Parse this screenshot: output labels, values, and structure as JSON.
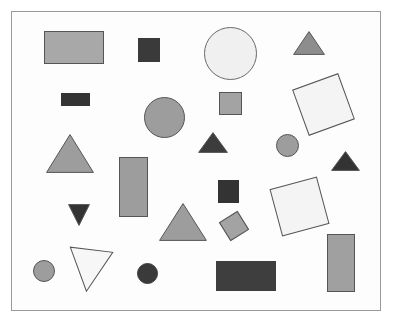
{
  "figure": {
    "width": 393,
    "height": 324,
    "background_color": "#ffffff",
    "frame": {
      "name": "canvas-frame",
      "x": 11,
      "y": 11,
      "width": 370,
      "height": 300,
      "fill_color": "#fdfdfd",
      "border_color": "#9a9a9a"
    },
    "palette": {
      "light_gray": "#d8d8d8",
      "medium_gray": "#a0a0a0",
      "gray": "#9d9d9d",
      "dark_gray": "#3a3a3a",
      "charcoal": "#414141",
      "white": "#fafafa",
      "outline": "#555555"
    },
    "shape_count": 24,
    "shapes": [
      {
        "id": "rect-gray-top-left",
        "type": "rectangle",
        "label": "large light gray rectangle",
        "x": 43,
        "y": 30,
        "width": 60,
        "height": 33,
        "rotation": 0,
        "fill": "#a8a8a8",
        "stroke": "#555555"
      },
      {
        "id": "square-dark-top",
        "type": "square",
        "label": "small dark square",
        "x": 137,
        "y": 37,
        "width": 22,
        "height": 24,
        "rotation": 0,
        "fill": "#3a3a3a",
        "stroke": "#3a3a3a"
      },
      {
        "id": "circle-light-large",
        "type": "circle",
        "label": "large very light circle",
        "x": 203,
        "y": 26,
        "width": 53,
        "height": 53,
        "rotation": 0,
        "fill": "#f0f0f0",
        "stroke": "#6a6a6a"
      },
      {
        "id": "triangle-gray-top-right",
        "type": "triangle",
        "label": "small gray triangle pointing up",
        "x": 292,
        "y": 30,
        "width": 32,
        "height": 24,
        "rotation": 0,
        "fill": "#8d8d8d",
        "stroke": "#555555"
      },
      {
        "id": "rect-dark-small",
        "type": "rectangle",
        "label": "small dark rectangle",
        "x": 60,
        "y": 92,
        "width": 29,
        "height": 13,
        "rotation": 0,
        "fill": "#343434",
        "stroke": "#343434"
      },
      {
        "id": "circle-gray-medium",
        "type": "circle",
        "label": "medium gray circle",
        "x": 143,
        "y": 96,
        "width": 41,
        "height": 41,
        "rotation": 0,
        "fill": "#9d9d9d",
        "stroke": "#555555"
      },
      {
        "id": "square-gray-small",
        "type": "square",
        "label": "small gray square",
        "x": 218,
        "y": 91,
        "width": 23,
        "height": 23,
        "rotation": 0,
        "fill": "#a3a3a3",
        "stroke": "#555555"
      },
      {
        "id": "square-white-rotated-upper",
        "type": "square",
        "label": "large white square rotated",
        "x": 298,
        "y": 79,
        "width": 49,
        "height": 49,
        "rotation": -20,
        "fill": "#f4f4f4",
        "stroke": "#555555"
      },
      {
        "id": "triangle-gray-large-left",
        "type": "triangle",
        "label": "large gray triangle pointing up",
        "x": 45,
        "y": 133,
        "width": 48,
        "height": 39,
        "rotation": 0,
        "fill": "#9d9d9d",
        "stroke": "#555555"
      },
      {
        "id": "triangle-dark-middle",
        "type": "triangle",
        "label": "dark triangle pointing up",
        "x": 197,
        "y": 131,
        "width": 30,
        "height": 21,
        "rotation": 0,
        "fill": "#3c3c3c",
        "stroke": "#3c3c3c"
      },
      {
        "id": "circle-gray-small-right",
        "type": "circle",
        "label": "small gray circle",
        "x": 275,
        "y": 133,
        "width": 23,
        "height": 23,
        "rotation": 0,
        "fill": "#9d9d9d",
        "stroke": "#555555"
      },
      {
        "id": "triangle-dark-right",
        "type": "triangle",
        "label": "small dark triangle pointing up",
        "x": 330,
        "y": 150,
        "width": 29,
        "height": 20,
        "rotation": 0,
        "fill": "#333333",
        "stroke": "#333333"
      },
      {
        "id": "rect-gray-tall",
        "type": "rectangle",
        "label": "tall gray rectangle",
        "x": 118,
        "y": 156,
        "width": 29,
        "height": 60,
        "rotation": 0,
        "fill": "#9d9d9d",
        "stroke": "#555555"
      },
      {
        "id": "square-dark-middle",
        "type": "square",
        "label": "dark square",
        "x": 217,
        "y": 179,
        "width": 21,
        "height": 23,
        "rotation": 0,
        "fill": "#333333",
        "stroke": "#333333"
      },
      {
        "id": "square-white-rotated-lower",
        "type": "square",
        "label": "large white square rotated",
        "x": 274,
        "y": 181,
        "width": 49,
        "height": 49,
        "rotation": -15,
        "fill": "#f4f4f4",
        "stroke": "#555555"
      },
      {
        "id": "triangle-dark-down",
        "type": "triangle",
        "label": "small dark triangle pointing down",
        "x": 67,
        "y": 203,
        "width": 22,
        "height": 22,
        "rotation": 180,
        "fill": "#333333",
        "stroke": "#333333"
      },
      {
        "id": "triangle-gray-large-center",
        "type": "triangle",
        "label": "large gray triangle pointing up",
        "x": 158,
        "y": 202,
        "width": 48,
        "height": 38,
        "rotation": 0,
        "fill": "#9d9d9d",
        "stroke": "#555555"
      },
      {
        "id": "square-gray-rotated-small",
        "type": "square",
        "label": "small gray square rotated",
        "x": 222,
        "y": 214,
        "width": 22,
        "height": 22,
        "rotation": -32,
        "fill": "#a3a3a3",
        "stroke": "#555555"
      },
      {
        "id": "rect-gray-tall-right",
        "type": "rectangle",
        "label": "tall gray rectangle",
        "x": 326,
        "y": 233,
        "width": 28,
        "height": 58,
        "rotation": 0,
        "fill": "#a0a0a0",
        "stroke": "#555555"
      },
      {
        "id": "triangle-white-down",
        "type": "triangle",
        "label": "white triangle pointing down tilted",
        "x": 66,
        "y": 248,
        "width": 44,
        "height": 43,
        "rotation": 187,
        "fill": "#f7f7f7",
        "stroke": "#555555"
      },
      {
        "id": "circle-gray-bottom-left",
        "type": "circle",
        "label": "small gray circle",
        "x": 32,
        "y": 259,
        "width": 22,
        "height": 22,
        "rotation": 0,
        "fill": "#9d9d9d",
        "stroke": "#555555"
      },
      {
        "id": "circle-dark-bottom",
        "type": "circle",
        "label": "small dark circle",
        "x": 136,
        "y": 262,
        "width": 21,
        "height": 21,
        "rotation": 0,
        "fill": "#3a3a3a",
        "stroke": "#3a3a3a"
      },
      {
        "id": "rect-dark-bottom",
        "type": "rectangle",
        "label": "large dark rectangle",
        "x": 215,
        "y": 260,
        "width": 60,
        "height": 30,
        "rotation": 0,
        "fill": "#3e3e3e",
        "stroke": "#3e3e3e"
      }
    ]
  }
}
